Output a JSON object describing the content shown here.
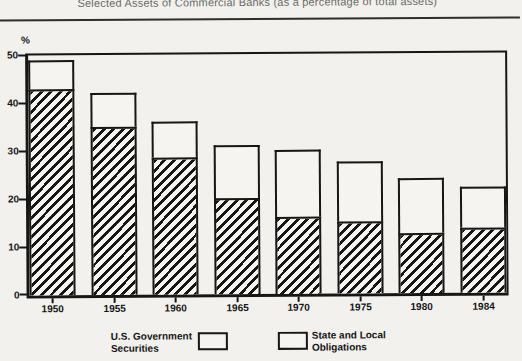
{
  "title": "Selected Assets of Commercial Banks (as a percentage of total assets)",
  "y_axis": {
    "unit_label": "%",
    "ticks": [
      0,
      10,
      20,
      30,
      40,
      50
    ]
  },
  "legend": {
    "us_gov": {
      "line1": "U.S. Government",
      "line2": "Securities",
      "swatch": "hatched"
    },
    "state_local": {
      "line1": "State and Local",
      "line2": "Obligations",
      "swatch": "open"
    }
  },
  "colors": {
    "ink": "#161616",
    "paper": "#f2f1ed",
    "bar_fill": "#f5f4f0",
    "title_gray": "#6a6a6a",
    "rule": "#2e2e2e"
  },
  "chart_data": {
    "type": "bar",
    "stacked": true,
    "title": "Selected Assets of Commercial Banks (as a percentage of total assets)",
    "categories": [
      "1950",
      "1955",
      "1960",
      "1965",
      "1970",
      "1975",
      "1980",
      "1984"
    ],
    "series": [
      {
        "name": "U.S. Government Securities",
        "pattern": "hatched",
        "values": [
          43,
          35,
          28.5,
          20,
          16,
          15,
          12.5,
          13.5
        ]
      },
      {
        "name": "State and Local Obligations",
        "pattern": "open",
        "values": [
          6,
          7,
          7.5,
          11,
          14,
          12.5,
          11.5,
          8.5
        ]
      }
    ],
    "totals": [
      49,
      42,
      36,
      31,
      30,
      27.5,
      24,
      22
    ],
    "xlabel": "",
    "ylabel": "%",
    "ylim": [
      0,
      50
    ],
    "grid": false,
    "legend_position": "bottom"
  }
}
